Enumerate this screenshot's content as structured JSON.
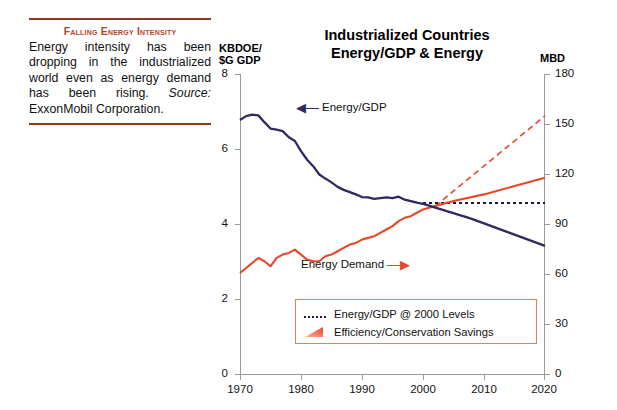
{
  "caption": {
    "title": "Falling Energy Intensity",
    "body_1": "Energy intensity has been dropping in the industrialized world even as energy demand has been rising. ",
    "source_label": "Source:",
    "body_2": " ExxonMobil Corporation.",
    "rule_color": "#8b3a22",
    "title_color": "#b5462a"
  },
  "chart_data": {
    "type": "line",
    "title": "Industrialized Countries Energy/GDP & Energy",
    "title_line1": "Industrialized Countries",
    "title_line2": "Energy/GDP & Energy",
    "xlabel": "",
    "x_ticks": [
      "1970",
      "1980",
      "1990",
      "2000",
      "2010",
      "2020"
    ],
    "xlim": [
      1970,
      2020
    ],
    "left_axis": {
      "unit": "KBDOE/ $G GDP",
      "unit_line1": "KBDOE/",
      "unit_line2": "$G GDP",
      "ticks": [
        "0",
        "2",
        "4",
        "6",
        "8"
      ],
      "ylim": [
        0,
        8
      ]
    },
    "right_axis": {
      "unit": "MBD",
      "ticks": [
        "0",
        "30",
        "60",
        "90",
        "120",
        "150",
        "180"
      ],
      "ylim": [
        0,
        180
      ]
    },
    "grid": false,
    "legend_position": "inside-bottom-center",
    "colors": {
      "energy_gdp": "#2e2a5e",
      "energy_demand": "#e8472a",
      "savings_fill": "#ef6a42",
      "dotted_reference": "#1a1a40"
    },
    "annotations": [
      {
        "text": "Energy/GDP",
        "arrow": "left",
        "series": "energy_gdp",
        "x": 1981,
        "y_left": 7.1
      },
      {
        "text": "Energy Demand",
        "arrow": "right",
        "series": "energy_demand",
        "x": 1983,
        "y_right": 58
      }
    ],
    "legend": [
      {
        "label": "Energy/GDP @ 2000 Levels",
        "marker": "dotted-line"
      },
      {
        "label": "Efficiency/Conservation Savings",
        "marker": "filled-triangle"
      }
    ],
    "series": [
      {
        "name": "Energy/GDP",
        "axis": "left",
        "unit": "KBDOE/$G GDP",
        "style": "solid",
        "color": "#2e2a5e",
        "x": [
          1970,
          1971,
          1972,
          1973,
          1974,
          1975,
          1976,
          1977,
          1978,
          1979,
          1980,
          1981,
          1982,
          1983,
          1984,
          1985,
          1986,
          1987,
          1988,
          1989,
          1990,
          1991,
          1992,
          1993,
          1994,
          1995,
          1996,
          1997,
          1998,
          1999,
          2000,
          2001,
          2002,
          2003,
          2004,
          2005,
          2006,
          2007,
          2008,
          2009,
          2010,
          2011,
          2012,
          2013,
          2014,
          2015,
          2016,
          2017,
          2018,
          2019,
          2020
        ],
        "values": [
          6.78,
          6.88,
          6.92,
          6.9,
          6.72,
          6.55,
          6.52,
          6.48,
          6.32,
          6.22,
          5.95,
          5.72,
          5.55,
          5.33,
          5.22,
          5.12,
          5.0,
          4.92,
          4.86,
          4.8,
          4.73,
          4.72,
          4.68,
          4.7,
          4.72,
          4.7,
          4.74,
          4.66,
          4.62,
          4.58,
          4.55,
          4.5,
          4.45,
          4.4,
          4.35,
          4.3,
          4.25,
          4.2,
          4.15,
          4.09,
          4.03,
          3.97,
          3.91,
          3.85,
          3.79,
          3.73,
          3.67,
          3.61,
          3.55,
          3.49,
          3.43
        ]
      },
      {
        "name": "Energy/GDP @ 2000 Levels",
        "axis": "left",
        "unit": "KBDOE/$G GDP",
        "style": "dotted",
        "color": "#1a1a40",
        "x": [
          2000,
          2020
        ],
        "values": [
          4.57,
          4.57
        ]
      },
      {
        "name": "Energy Demand",
        "axis": "right",
        "unit": "MBD",
        "style": "solid",
        "color": "#e8472a",
        "x": [
          1970,
          1971,
          1972,
          1973,
          1974,
          1975,
          1976,
          1977,
          1978,
          1979,
          1980,
          1981,
          1982,
          1983,
          1984,
          1985,
          1986,
          1987,
          1988,
          1989,
          1990,
          1991,
          1992,
          1993,
          1994,
          1995,
          1996,
          1997,
          1998,
          1999,
          2000,
          2002,
          2005,
          2010,
          2015,
          2020
        ],
        "values": [
          61,
          64,
          67,
          70,
          68,
          65,
          70,
          72,
          73,
          75,
          72,
          69,
          68,
          68,
          71,
          72,
          74,
          76,
          78,
          79,
          81,
          82,
          83,
          85,
          87,
          89,
          92,
          94,
          95,
          97,
          99,
          101,
          104,
          108,
          113,
          118
        ]
      },
      {
        "name": "Demand without efficiency gains",
        "axis": "right",
        "unit": "MBD",
        "style": "dashed",
        "color": "#e8472a",
        "x": [
          2002,
          2020
        ],
        "values": [
          101,
          155
        ]
      }
    ],
    "savings_region": {
      "description": "Shaded wedge between Energy Demand and Demand without efficiency gains",
      "x_start": 2002,
      "x_end": 2020,
      "color": "#ef6a42"
    }
  }
}
